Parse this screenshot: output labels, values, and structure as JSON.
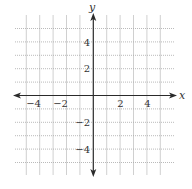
{
  "diagram": {
    "type": "coordinate-plane",
    "x_axis": {
      "label": "x",
      "min": -5,
      "max": 5,
      "tick_labels": [
        "−4",
        "−2",
        "2",
        "4"
      ],
      "tick_values": [
        -4,
        -2,
        2,
        4
      ]
    },
    "y_axis": {
      "label": "y",
      "min": -5,
      "max": 5,
      "tick_labels": [
        "4",
        "2",
        "−2",
        "−4"
      ],
      "tick_values": [
        4,
        2,
        -2,
        -4
      ]
    },
    "grid": {
      "step": 1,
      "lines_per_axis": 11
    },
    "colors": {
      "axis": "#2a2a2a",
      "grid_vertical": "#c4c4c4",
      "grid_horizontal": "#a8a8a8",
      "text": "#333333",
      "background": "#ffffff"
    }
  }
}
